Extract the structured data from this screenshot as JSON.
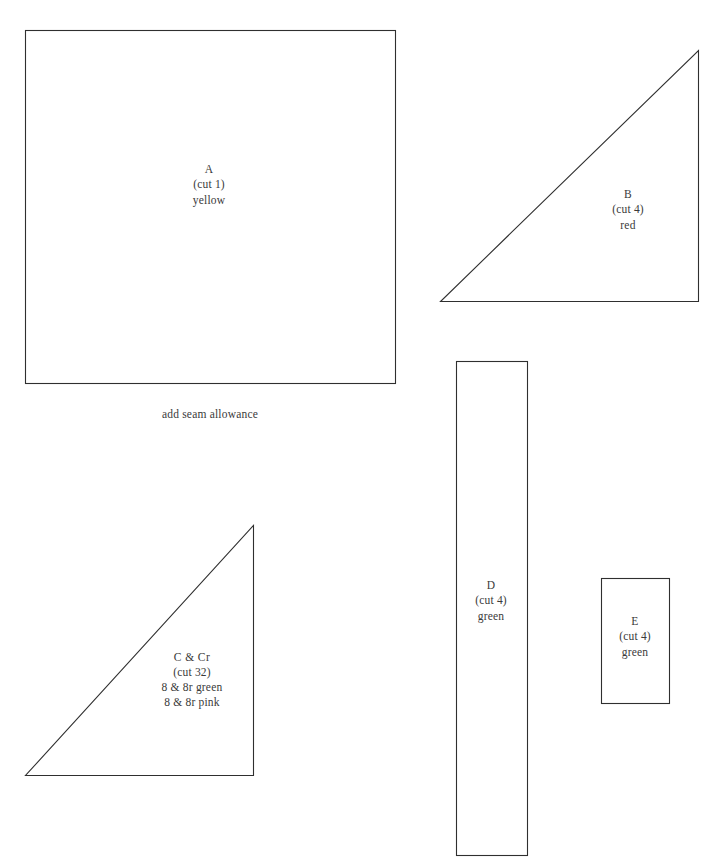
{
  "document": {
    "title": "Quilt Block Pattern Template Sheet",
    "background_color": "#ffffff",
    "line_color": "#2f2f2f",
    "text_color": "#3a3a3a"
  },
  "notes": [
    {
      "id": "seam-allowance-note",
      "text": "add seam allowance",
      "x": 210,
      "y": 414
    }
  ],
  "pieces": [
    {
      "id": "A",
      "name": "A",
      "shape": "rectangle",
      "cut": "(cut 1)",
      "fabrics": [
        "yellow"
      ],
      "label_lines": [
        "A",
        "(cut 1)",
        "yellow"
      ],
      "label_x": 209,
      "label_y": 185,
      "geometry": {
        "x": 25,
        "y": 30,
        "width": 370,
        "height": 353
      }
    },
    {
      "id": "B",
      "name": "B",
      "shape": "right-triangle",
      "cut": "(cut 4)",
      "fabrics": [
        "red"
      ],
      "label_lines": [
        "B",
        "(cut 4)",
        "red"
      ],
      "label_x": 628,
      "label_y": 210,
      "geometry": {
        "points": [
          [
            698,
            50
          ],
          [
            698,
            301
          ],
          [
            440,
            301
          ]
        ]
      }
    },
    {
      "id": "C",
      "name": "C & Cr",
      "shape": "right-triangle",
      "cut": "(cut 32)",
      "fabrics": [
        "8 & 8r green",
        "8 & 8r pink"
      ],
      "label_lines": [
        "C & Cr",
        "(cut 32)",
        "8 & 8r green",
        "8 & 8r pink"
      ],
      "label_x": 192,
      "label_y": 680,
      "geometry": {
        "points": [
          [
            253,
            525
          ],
          [
            253,
            775
          ],
          [
            25,
            775
          ]
        ]
      }
    },
    {
      "id": "D",
      "name": "D",
      "shape": "rectangle",
      "cut": "(cut 4)",
      "fabrics": [
        "green"
      ],
      "label_lines": [
        "D",
        "(cut 4)",
        "green"
      ],
      "label_x": 491,
      "label_y": 601,
      "geometry": {
        "x": 456,
        "y": 361,
        "width": 71,
        "height": 494
      }
    },
    {
      "id": "E",
      "name": "E",
      "shape": "rectangle",
      "cut": "(cut 4)",
      "fabrics": [
        "green"
      ],
      "label_lines": [
        "E",
        "(cut 4)",
        "green"
      ],
      "label_x": 635,
      "label_y": 637,
      "geometry": {
        "x": 601,
        "y": 578,
        "width": 68,
        "height": 125
      }
    }
  ]
}
